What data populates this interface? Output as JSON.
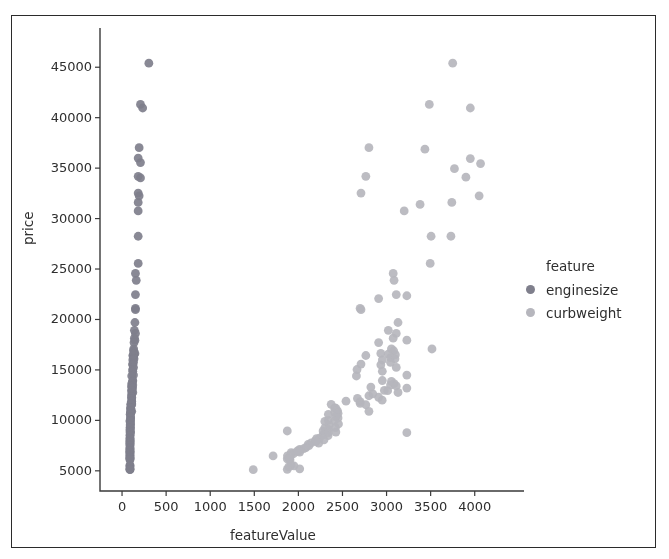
{
  "chart_data": {
    "type": "scatter",
    "title": "",
    "xlabel": "featureValue",
    "ylabel": "price",
    "xlim": [
      -250,
      4400
    ],
    "ylim": [
      3000,
      47500
    ],
    "xticks": [
      0,
      500,
      1000,
      1500,
      2000,
      2500,
      3000,
      3500,
      4000
    ],
    "xtick_labels": [
      "0",
      "500",
      "1000",
      "1500",
      "2000",
      "2500",
      "3000",
      "3500",
      "4000"
    ],
    "yticks": [
      5000,
      10000,
      15000,
      20000,
      25000,
      30000,
      35000,
      40000,
      45000
    ],
    "ytick_labels": [
      "5000",
      "10000",
      "15000",
      "20000",
      "25000",
      "30000",
      "35000",
      "40000",
      "45000"
    ],
    "grid": false,
    "legend": {
      "title": "feature",
      "position": "right-outside",
      "entries": [
        {
          "name": "enginesize",
          "color": "#7f7f8c"
        },
        {
          "name": "curbweight",
          "color": "#b6b6bd"
        }
      ]
    },
    "marker_size": 7,
    "series": [
      {
        "name": "enginesize",
        "color": "#7f7f8c",
        "points": [
          [
            304,
            45400
          ],
          [
            209,
            41315
          ],
          [
            234,
            40960
          ],
          [
            194,
            37028
          ],
          [
            183,
            36000
          ],
          [
            209,
            35550
          ],
          [
            183,
            34184
          ],
          [
            209,
            34028
          ],
          [
            183,
            32528
          ],
          [
            194,
            32250
          ],
          [
            183,
            31600
          ],
          [
            183,
            30760
          ],
          [
            183,
            28248
          ],
          [
            183,
            25552
          ],
          [
            152,
            24565
          ],
          [
            161,
            23875
          ],
          [
            152,
            22470
          ],
          [
            152,
            21105
          ],
          [
            152,
            20970
          ],
          [
            146,
            19699
          ],
          [
            140,
            18920
          ],
          [
            152,
            18620
          ],
          [
            140,
            18150
          ],
          [
            146,
            17950
          ],
          [
            136,
            17710
          ],
          [
            132,
            17075
          ],
          [
            130,
            16900
          ],
          [
            146,
            16630
          ],
          [
            136,
            16558
          ],
          [
            130,
            16515
          ],
          [
            122,
            16430
          ],
          [
            130,
            16225
          ],
          [
            136,
            16103
          ],
          [
            122,
            15985
          ],
          [
            130,
            15750
          ],
          [
            120,
            15580
          ],
          [
            122,
            15510
          ],
          [
            130,
            15250
          ],
          [
            120,
            15040
          ],
          [
            122,
            14869
          ],
          [
            130,
            14489
          ],
          [
            110,
            14399
          ],
          [
            122,
            13950
          ],
          [
            120,
            13860
          ],
          [
            110,
            13645
          ],
          [
            122,
            13499
          ],
          [
            109,
            13415
          ],
          [
            110,
            13295
          ],
          [
            120,
            13200
          ],
          [
            110,
            12964
          ],
          [
            109,
            12945
          ],
          [
            122,
            12764
          ],
          [
            110,
            12629
          ],
          [
            108,
            12440
          ],
          [
            110,
            12290
          ],
          [
            109,
            12170
          ],
          [
            110,
            11900
          ],
          [
            108,
            11850
          ],
          [
            109,
            11694
          ],
          [
            98,
            11595
          ],
          [
            110,
            11549
          ],
          [
            97,
            11248
          ],
          [
            98,
            11199
          ],
          [
            97,
            10945
          ],
          [
            110,
            10898
          ],
          [
            98,
            10795
          ],
          [
            97,
            10698
          ],
          [
            92,
            10595
          ],
          [
            97,
            10345
          ],
          [
            98,
            10245
          ],
          [
            92,
            9995
          ],
          [
            97,
            9959
          ],
          [
            90,
            9895
          ],
          [
            98,
            9639
          ],
          [
            92,
            9538
          ],
          [
            97,
            9279
          ],
          [
            90,
            9258
          ],
          [
            92,
            9095
          ],
          [
            90,
            8948
          ],
          [
            97,
            8845
          ],
          [
            92,
            8778
          ],
          [
            90,
            8558
          ],
          [
            92,
            8495
          ],
          [
            90,
            8249
          ],
          [
            90,
            8189
          ],
          [
            92,
            8058
          ],
          [
            90,
            7975
          ],
          [
            90,
            7898
          ],
          [
            90,
            7775
          ],
          [
            91,
            7738
          ],
          [
            90,
            7609
          ],
          [
            90,
            7499
          ],
          [
            90,
            7295
          ],
          [
            90,
            7198
          ],
          [
            90,
            7129
          ],
          [
            90,
            6989
          ],
          [
            90,
            6938
          ],
          [
            90,
            6855
          ],
          [
            90,
            6795
          ],
          [
            90,
            6692
          ],
          [
            90,
            6575
          ],
          [
            90,
            6488
          ],
          [
            90,
            6377
          ],
          [
            90,
            6295
          ],
          [
            90,
            6229
          ],
          [
            90,
            6189
          ],
          [
            90,
            6095
          ],
          [
            90,
            5572
          ],
          [
            90,
            5499
          ],
          [
            90,
            5389
          ],
          [
            90,
            5195
          ],
          [
            90,
            5151
          ],
          [
            90,
            5118
          ]
        ]
      },
      {
        "name": "curbweight",
        "color": "#b6b6bd",
        "points": [
          [
            3750,
            45400
          ],
          [
            3485,
            41315
          ],
          [
            3950,
            40960
          ],
          [
            2800,
            37028
          ],
          [
            3435,
            36880
          ],
          [
            3950,
            35950
          ],
          [
            4066,
            35450
          ],
          [
            3770,
            34950
          ],
          [
            2765,
            34184
          ],
          [
            3900,
            34100
          ],
          [
            2710,
            32528
          ],
          [
            3740,
            31600
          ],
          [
            3380,
            31400
          ],
          [
            4050,
            32250
          ],
          [
            3200,
            30760
          ],
          [
            3505,
            28248
          ],
          [
            3730,
            28250
          ],
          [
            3495,
            25552
          ],
          [
            3075,
            24565
          ],
          [
            3085,
            23875
          ],
          [
            3110,
            22470
          ],
          [
            3230,
            22350
          ],
          [
            2910,
            22070
          ],
          [
            2700,
            21105
          ],
          [
            2710,
            20970
          ],
          [
            3130,
            19699
          ],
          [
            3020,
            18920
          ],
          [
            3110,
            18620
          ],
          [
            3075,
            18150
          ],
          [
            3230,
            17950
          ],
          [
            2910,
            17710
          ],
          [
            3055,
            17075
          ],
          [
            3080,
            16900
          ],
          [
            3515,
            17075
          ],
          [
            2935,
            16630
          ],
          [
            3020,
            16558
          ],
          [
            3100,
            16515
          ],
          [
            2765,
            16430
          ],
          [
            3045,
            16225
          ],
          [
            3095,
            16103
          ],
          [
            2952,
            15985
          ],
          [
            3045,
            15750
          ],
          [
            2710,
            15580
          ],
          [
            2935,
            15510
          ],
          [
            3110,
            15250
          ],
          [
            2665,
            15040
          ],
          [
            2952,
            14869
          ],
          [
            3230,
            14489
          ],
          [
            2658,
            14399
          ],
          [
            2952,
            13950
          ],
          [
            3055,
            13860
          ],
          [
            3085,
            13645
          ],
          [
            3045,
            13499
          ],
          [
            3110,
            13415
          ],
          [
            2822,
            13295
          ],
          [
            3230,
            13200
          ],
          [
            2975,
            12964
          ],
          [
            3012,
            12945
          ],
          [
            3130,
            12764
          ],
          [
            2844,
            12629
          ],
          [
            2800,
            12440
          ],
          [
            2910,
            12290
          ],
          [
            2670,
            12170
          ],
          [
            2540,
            11900
          ],
          [
            2700,
            11850
          ],
          [
            2700,
            11694
          ],
          [
            2372,
            11595
          ],
          [
            2765,
            11549
          ],
          [
            2410,
            11248
          ],
          [
            2425,
            11199
          ],
          [
            2443,
            10945
          ],
          [
            2800,
            10898
          ],
          [
            2410,
            10795
          ],
          [
            2450,
            10698
          ],
          [
            2340,
            10595
          ],
          [
            2425,
            10345
          ],
          [
            2450,
            10245
          ],
          [
            2340,
            9995
          ],
          [
            2410,
            9959
          ],
          [
            2300,
            9895
          ],
          [
            2455,
            9639
          ],
          [
            2350,
            9538
          ],
          [
            2420,
            9279
          ],
          [
            2300,
            9258
          ],
          [
            2340,
            9095
          ],
          [
            2280,
            8948
          ],
          [
            2425,
            8845
          ],
          [
            2340,
            8778
          ],
          [
            2280,
            8558
          ],
          [
            2337,
            8495
          ],
          [
            2240,
            8249
          ],
          [
            2206,
            8189
          ],
          [
            2290,
            8058
          ],
          [
            2190,
            7975
          ],
          [
            2200,
            7898
          ],
          [
            2145,
            7775
          ],
          [
            2230,
            7738
          ],
          [
            2109,
            7609
          ],
          [
            2120,
            7499
          ],
          [
            2085,
            7295
          ],
          [
            2061,
            7198
          ],
          [
            2015,
            7129
          ],
          [
            2010,
            6989
          ],
          [
            1985,
            6938
          ],
          [
            2015,
            6855
          ],
          [
            1918,
            6795
          ],
          [
            1944,
            6692
          ],
          [
            1909,
            6575
          ],
          [
            1876,
            6488
          ],
          [
            1905,
            6377
          ],
          [
            1890,
            6295
          ],
          [
            1900,
            6229
          ],
          [
            1874,
            6189
          ],
          [
            1905,
            6095
          ],
          [
            1918,
            5572
          ],
          [
            1950,
            5499
          ],
          [
            1890,
            5389
          ],
          [
            2015,
            5195
          ],
          [
            1874,
            5151
          ],
          [
            1488,
            5118
          ],
          [
            1713,
            6479
          ],
          [
            1874,
            8949
          ],
          [
            3230,
            8778
          ],
          [
            2950,
            12000
          ]
        ]
      }
    ]
  },
  "axes": {
    "x_axis_label": "featureValue",
    "y_axis_label": "price"
  }
}
